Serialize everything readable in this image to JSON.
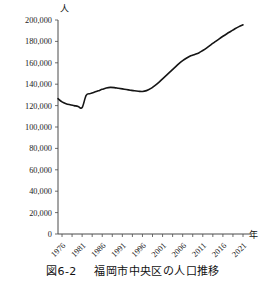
{
  "figure": {
    "caption_number": "図6-2",
    "caption_text": "福岡市中央区の人口推移",
    "y_unit_label": "人",
    "x_unit_label": "年"
  },
  "chart_data": {
    "type": "line",
    "title": "福岡市中央区の人口推移",
    "xlabel": "年",
    "ylabel": "人",
    "xlim": [
      1975,
      2021
    ],
    "ylim": [
      0,
      200000
    ],
    "ytick_labels": [
      "0",
      "20,000",
      "40,000",
      "60,000",
      "80,000",
      "100,000",
      "120,000",
      "140,000",
      "160,000",
      "180,000",
      "200,000"
    ],
    "ytick_values": [
      0,
      20000,
      40000,
      60000,
      80000,
      100000,
      120000,
      140000,
      160000,
      180000,
      200000
    ],
    "xtick_labels": [
      "1976",
      "1981",
      "1986",
      "1991",
      "1996",
      "2001",
      "2006",
      "2011",
      "2016",
      "2021"
    ],
    "xtick_values": [
      1976,
      1981,
      1986,
      1991,
      1996,
      2001,
      2006,
      2011,
      2016,
      2021
    ],
    "xtick_rotation_deg": 45,
    "grid": false,
    "legend": null,
    "series": [
      {
        "name": "福岡市中央区人口",
        "color": "#151515",
        "x": [
          1975,
          1976,
          1977,
          1978,
          1979,
          1980,
          1981,
          1982,
          1983,
          1984,
          1985,
          1986,
          1987,
          1988,
          1989,
          1990,
          1991,
          1992,
          1993,
          1994,
          1995,
          1996,
          1997,
          1998,
          1999,
          2000,
          2001,
          2002,
          2003,
          2004,
          2005,
          2006,
          2007,
          2008,
          2009,
          2010,
          2011,
          2012,
          2013,
          2014,
          2015,
          2016,
          2017,
          2018,
          2019,
          2020,
          2021
        ],
        "values": [
          126500,
          123500,
          121800,
          120800,
          120000,
          119200,
          118200,
          129500,
          131200,
          132500,
          133800,
          135200,
          136400,
          137000,
          136800,
          136200,
          135600,
          135000,
          134400,
          133800,
          133400,
          133200,
          134000,
          135800,
          138500,
          141500,
          145000,
          148500,
          152000,
          155500,
          159000,
          162000,
          164500,
          166500,
          167800,
          169200,
          171500,
          174000,
          176800,
          179500,
          182200,
          184800,
          187200,
          189500,
          191800,
          193800,
          195500
        ]
      }
    ]
  }
}
